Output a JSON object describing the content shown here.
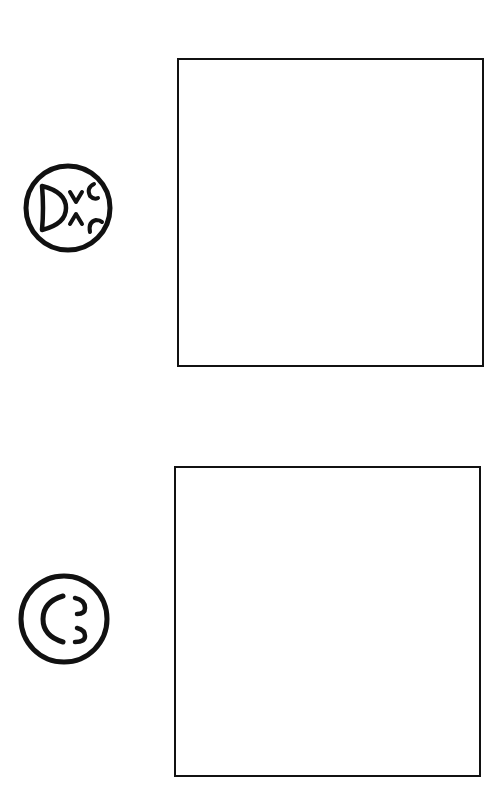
{
  "page": {
    "background": "#ffffff",
    "ink_color": "#111111"
  },
  "items": [
    {
      "symbol": "circle-with-d-and-arrow-marks-icon",
      "box": "empty-drawing-box"
    },
    {
      "symbol": "circle-with-c-and-two-hooks-icon",
      "box": "empty-drawing-box"
    }
  ]
}
